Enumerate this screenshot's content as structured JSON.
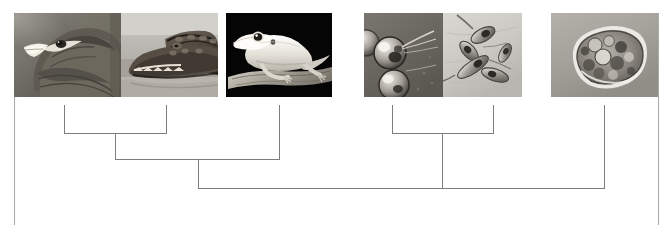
{
  "figure": {
    "type": "cladogram",
    "width": 670,
    "height": 228,
    "background_color": "#ffffff",
    "line_color": "#7d7d7d",
    "border_color": "#a8a8a8"
  },
  "taxa": [
    {
      "id": "taxon-1",
      "label": "eagle",
      "image_name": "eagle-head-photo",
      "tip_x": 64,
      "photo": {
        "x": 14,
        "y": 13,
        "w": 107,
        "h": 84
      }
    },
    {
      "id": "taxon-2",
      "label": "crocodile",
      "image_name": "crocodile-head-photo",
      "tip_x": 166,
      "photo": {
        "x": 121,
        "y": 13,
        "w": 97,
        "h": 84
      }
    },
    {
      "id": "taxon-3",
      "label": "gecko",
      "image_name": "gecko-lizard-photo",
      "tip_x": 279,
      "photo": {
        "x": 226,
        "y": 13,
        "w": 106,
        "h": 84
      }
    },
    {
      "id": "taxon-4",
      "label": "flagellated cells",
      "image_name": "flagellated-cells-photo",
      "tip_x": 392,
      "photo": {
        "x": 364,
        "y": 13,
        "w": 79,
        "h": 84
      }
    },
    {
      "id": "taxon-5",
      "label": "spindle cells cluster",
      "image_name": "spindle-cells-photo",
      "tip_x": 493,
      "photo": {
        "x": 443,
        "y": 13,
        "w": 79,
        "h": 84
      }
    },
    {
      "id": "taxon-6",
      "label": "amoeba",
      "image_name": "amoeba-photo",
      "tip_x": 604,
      "photo": {
        "x": 551,
        "y": 13,
        "w": 107,
        "h": 84
      }
    }
  ],
  "tree": {
    "tip_top_y": 105,
    "clade_bar_y": 133,
    "internal_bar_y": 159,
    "root_bar_y": 188,
    "nodes": [
      {
        "id": "clade-archosaurs",
        "name": "eagle-crocodile-clade",
        "bar_y": 133,
        "from_x": 64,
        "to_x": 166,
        "stem_x": 115,
        "stem_to_y": 159
      },
      {
        "id": "clade-reptiles",
        "name": "reptile-clade",
        "bar_y": 159,
        "from_x": 115,
        "to_x": 279,
        "stem_x": 198,
        "stem_to_y": 188
      },
      {
        "id": "clade-protists",
        "name": "protist-cells-clade",
        "bar_y": 133,
        "from_x": 392,
        "to_x": 493,
        "stem_x": 442,
        "stem_to_y": 188
      },
      {
        "id": "root",
        "name": "root-node",
        "bar_y": 188,
        "from_x": 198,
        "to_x": 604,
        "stem_x": 442,
        "stem_to_y": 188
      }
    ]
  },
  "frame": {
    "left_rule": {
      "x": 14,
      "y_top": 13,
      "y_bottom": 225
    },
    "right_rule": {
      "x": 658,
      "y_top": 13,
      "y_bottom": 225
    }
  }
}
